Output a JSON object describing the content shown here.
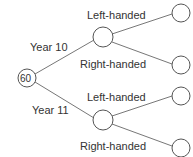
{
  "tree": {
    "root": {
      "value": "60"
    },
    "branches": [
      {
        "label": "Year 10",
        "children": [
          {
            "label": "Left-handed"
          },
          {
            "label": "Right-handed"
          }
        ]
      },
      {
        "label": "Year 11",
        "children": [
          {
            "label": "Left-handed"
          },
          {
            "label": "Right-handed"
          }
        ]
      }
    ]
  },
  "colors": {
    "line": "#777777",
    "text": "#333333"
  }
}
